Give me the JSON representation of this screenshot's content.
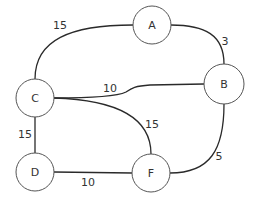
{
  "diagram": {
    "type": "weighted-undirected-graph",
    "nodes": [
      {
        "id": "A",
        "label": "A",
        "cx": 152,
        "cy": 25
      },
      {
        "id": "B",
        "label": "B",
        "cx": 224,
        "cy": 84
      },
      {
        "id": "C",
        "label": "C",
        "cx": 35,
        "cy": 98
      },
      {
        "id": "D",
        "label": "D",
        "cx": 35,
        "cy": 172
      },
      {
        "id": "F",
        "label": "F",
        "cx": 151,
        "cy": 173
      }
    ],
    "edges": [
      {
        "from": "C",
        "to": "A",
        "weight": "15",
        "label_x": 60,
        "label_y": 25
      },
      {
        "from": "A",
        "to": "B",
        "weight": "3",
        "label_x": 225,
        "label_y": 41
      },
      {
        "from": "C",
        "to": "B",
        "weight": "10",
        "label_x": 110,
        "label_y": 88
      },
      {
        "from": "C",
        "to": "F",
        "weight": "15",
        "label_x": 152,
        "label_y": 124
      },
      {
        "from": "C",
        "to": "D",
        "weight": "15",
        "label_x": 25,
        "label_y": 134
      },
      {
        "from": "D",
        "to": "F",
        "weight": "10",
        "label_x": 88,
        "label_y": 182
      },
      {
        "from": "B",
        "to": "F",
        "weight": "5",
        "label_x": 219,
        "label_y": 156
      }
    ],
    "colors": {
      "edge": "#2a2a2a",
      "node_border": "#555555",
      "node_fill": "#ffffff",
      "text": "#333333"
    }
  }
}
